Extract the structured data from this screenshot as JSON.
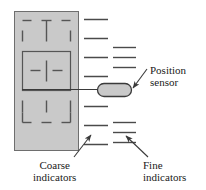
{
  "figure": {
    "type": "technical-diagram",
    "background_color": "#ffffff",
    "width": 206,
    "height": 190
  },
  "plate": {
    "name": "shaded-plate",
    "fill_color": "#c9c9c9",
    "stroke_color": "#6e6e6e",
    "x": 14,
    "y": 11,
    "width": 64,
    "height": 139
  },
  "inner_box": {
    "name": "inner-solid-box",
    "stroke_color": "#555555",
    "x": 22,
    "y": 51,
    "width": 48,
    "height": 39
  },
  "dashes": {
    "stroke_color": "#555555",
    "segments": [
      {
        "x1": 22,
        "y1": 20,
        "x2": 31,
        "y2": 20
      },
      {
        "x1": 41,
        "y1": 20,
        "x2": 51,
        "y2": 20
      },
      {
        "x1": 61,
        "y1": 20,
        "x2": 70,
        "y2": 20
      },
      {
        "x1": 22,
        "y1": 30,
        "x2": 22,
        "y2": 41
      },
      {
        "x1": 46,
        "y1": 20,
        "x2": 46,
        "y2": 41
      },
      {
        "x1": 70,
        "y1": 30,
        "x2": 70,
        "y2": 41
      },
      {
        "x1": 30,
        "y1": 70,
        "x2": 40,
        "y2": 70
      },
      {
        "x1": 52,
        "y1": 70,
        "x2": 62,
        "y2": 70
      },
      {
        "x1": 46,
        "y1": 60,
        "x2": 46,
        "y2": 81
      },
      {
        "x1": 22,
        "y1": 100,
        "x2": 22,
        "y2": 112
      },
      {
        "x1": 46,
        "y1": 100,
        "x2": 46,
        "y2": 112
      },
      {
        "x1": 70,
        "y1": 100,
        "x2": 70,
        "y2": 112
      },
      {
        "x1": 22,
        "y1": 122,
        "x2": 31,
        "y2": 122
      },
      {
        "x1": 41,
        "y1": 122,
        "x2": 51,
        "y2": 122
      },
      {
        "x1": 61,
        "y1": 122,
        "x2": 70,
        "y2": 122
      },
      {
        "x1": 22,
        "y1": 112,
        "x2": 22,
        "y2": 122
      },
      {
        "x1": 70,
        "y1": 112,
        "x2": 70,
        "y2": 122
      }
    ]
  },
  "coarse_indicators": {
    "name": "coarse-indicator-ticks",
    "label": "Coarse\nindicators",
    "label_line1": "Coarse",
    "label_line2": "indicators",
    "stroke_color": "#4a4a4a",
    "x_start": 84,
    "x_end": 108,
    "tick_y": [
      19,
      38,
      57,
      76,
      106,
      125,
      144
    ]
  },
  "fine_indicators": {
    "name": "fine-indicator-ticks",
    "label_line1": "Fine",
    "label_line2": "indicators",
    "stroke_color": "#4a4a4a",
    "x_start": 113,
    "x_end": 136,
    "tick_y": [
      47,
      57,
      67,
      122,
      132,
      142
    ]
  },
  "sensor": {
    "name": "position-sensor",
    "label_line1": "Position",
    "label_line2": "sensor",
    "fill_color": "#c9c9c9",
    "stroke_color": "#3a3a3a",
    "x": 97,
    "y": 83,
    "width": 34,
    "height": 13,
    "corner_radius": 6.5
  },
  "leader_lines": {
    "stroke_color": "#3a3a3a",
    "sensor_stem": {
      "x1": 22,
      "y1": 89,
      "x2": 97,
      "y2": 89
    },
    "sensor_arrow": {
      "x1": 147,
      "y1": 69,
      "x2": 133,
      "y2": 88
    },
    "coarse_arrow": {
      "x1": 74,
      "y1": 157,
      "x2": 91,
      "y2": 135
    },
    "fine_arrow": {
      "x1": 148,
      "y1": 157,
      "x2": 126,
      "y2": 136
    }
  }
}
